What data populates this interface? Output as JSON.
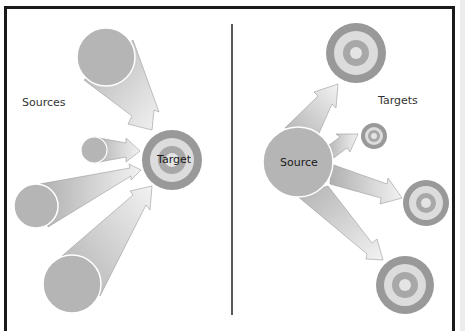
{
  "panels": {
    "left": {
      "label": "Sources",
      "center_label": "Target"
    },
    "right": {
      "label": "Targets",
      "center_label": "Source"
    }
  },
  "colors": {
    "frame": "#1a1a1a",
    "divider": "#222222",
    "source_fill": "#b5b5b5",
    "source_stroke": "#ffffff",
    "arrow_dark": "#b0b0b0",
    "arrow_light": "#f2f2f2",
    "target_outer": "#999999",
    "target_ring2": "#dcdcdc",
    "target_ring3": "#a8a8a8",
    "target_center": "#e4e4e4"
  },
  "diagram": {
    "left_sources": [
      {
        "cx": 106,
        "cy": 57,
        "r": 29
      },
      {
        "cx": 94,
        "cy": 150,
        "r": 13
      },
      {
        "cx": 36,
        "cy": 206,
        "r": 22
      },
      {
        "cx": 72,
        "cy": 284,
        "r": 29
      }
    ],
    "left_target": {
      "cx": 172,
      "cy": 160,
      "r": 30
    },
    "right_source": {
      "cx": 298,
      "cy": 162,
      "r": 35
    },
    "right_targets": [
      {
        "cx": 356,
        "cy": 53,
        "r": 30
      },
      {
        "cx": 374,
        "cy": 136,
        "r": 13
      },
      {
        "cx": 426,
        "cy": 203,
        "r": 23
      },
      {
        "cx": 405,
        "cy": 285,
        "r": 29
      }
    ]
  }
}
